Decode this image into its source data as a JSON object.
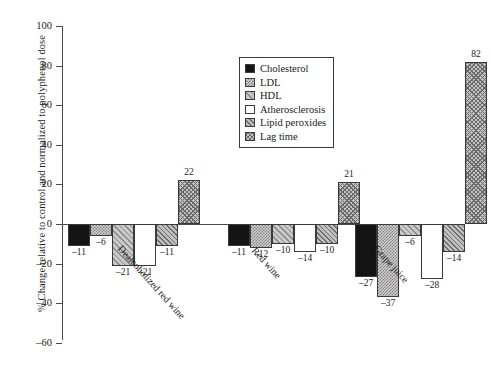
{
  "chart_data": {
    "type": "bar",
    "title": "",
    "xlabel": "",
    "ylabel": "% Change relative to control and normalized to polyphenol dose",
    "ylim": [
      -60,
      100
    ],
    "ytick_labels": [
      "100",
      "80",
      "60",
      "40",
      "20",
      "0",
      "–20",
      "–40",
      "–60"
    ],
    "ytick_values": [
      100,
      80,
      60,
      40,
      20,
      0,
      -20,
      -40,
      -60
    ],
    "grid": false,
    "legend_position": "upper-center",
    "categories": [
      "Dealcoholized red wine",
      "Red wine",
      "Grape juice"
    ],
    "series": [
      {
        "name": "Cholesterol",
        "pattern": "solid",
        "values": [
          -11,
          -11,
          -27
        ]
      },
      {
        "name": "LDL",
        "pattern": "cross1",
        "values": [
          -6,
          -12,
          -37
        ]
      },
      {
        "name": "HDL",
        "pattern": "diag",
        "values": [
          -21,
          -10,
          -6
        ]
      },
      {
        "name": "Atherosclerosis",
        "pattern": "white",
        "values": [
          -21,
          -14,
          -28
        ]
      },
      {
        "name": "Lipid peroxides",
        "pattern": "diag2",
        "values": [
          -11,
          -10,
          -14
        ]
      },
      {
        "name": "Lag time",
        "pattern": "cross2",
        "values": [
          22,
          21,
          82
        ]
      }
    ],
    "value_labels": {
      "Dealcoholized red wine": [
        "–11",
        "–6",
        "–21",
        "–21",
        "–11",
        "22"
      ],
      "Red wine": [
        "–11",
        "–12",
        "–10",
        "–14",
        "–10",
        "21"
      ],
      "Grape juice": [
        "–27",
        "–37",
        "–6",
        "–28",
        "–14",
        "82"
      ]
    }
  },
  "legend": {
    "items": [
      {
        "label": "Cholesterol"
      },
      {
        "label": "LDL"
      },
      {
        "label": "HDL"
      },
      {
        "label": "Atherosclerosis"
      },
      {
        "label": "Lipid peroxides"
      },
      {
        "label": "Lag time"
      }
    ]
  }
}
